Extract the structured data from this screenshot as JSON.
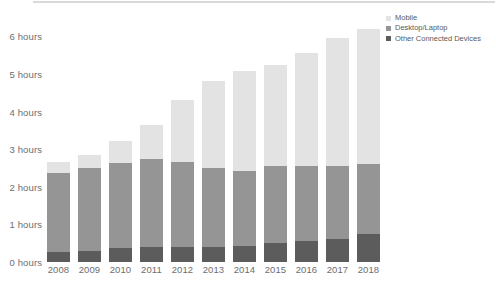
{
  "chart_data": {
    "type": "bar",
    "subtype": "stacked-bar",
    "title": "",
    "subtitle": "",
    "xlabel": "",
    "ylabel": "",
    "categories": [
      "2008",
      "2009",
      "2010",
      "2011",
      "2012",
      "2013",
      "2014",
      "2015",
      "2016",
      "2017",
      "2018"
    ],
    "series": [
      {
        "name": "Other Connected Devices",
        "color": "#5c5c5c",
        "values": [
          0.27,
          0.3,
          0.38,
          0.4,
          0.4,
          0.4,
          0.42,
          0.5,
          0.55,
          0.6,
          0.75
        ]
      },
      {
        "name": "Desktop/Laptop",
        "color": "#959595",
        "values": [
          2.1,
          2.2,
          2.25,
          2.35,
          2.25,
          2.1,
          2.0,
          2.05,
          2.0,
          1.95,
          1.85
        ]
      },
      {
        "name": "Mobile",
        "color": "#e3e3e3",
        "values": [
          0.3,
          0.35,
          0.6,
          0.9,
          1.65,
          2.3,
          2.65,
          2.7,
          3.0,
          3.4,
          3.6
        ]
      }
    ],
    "totals": [
      2.67,
      2.85,
      3.23,
      3.65,
      4.3,
      4.8,
      5.07,
      5.25,
      5.55,
      5.95,
      6.2
    ],
    "stack_order": [
      "Other Connected Devices",
      "Desktop/Laptop",
      "Mobile"
    ],
    "y_ticks": [
      {
        "value": 0,
        "label": "0 hours"
      },
      {
        "value": 1,
        "label": "1 hours"
      },
      {
        "value": 2,
        "label": "2 hours"
      },
      {
        "value": 3,
        "label": "3 hours"
      },
      {
        "value": 4,
        "label": "4 hours"
      },
      {
        "value": 5,
        "label": "5 hours"
      },
      {
        "value": 6,
        "label": "6 hours"
      }
    ],
    "ylim": [
      0,
      6.7
    ],
    "grid": false,
    "legend_position": "top-right",
    "legend": [
      {
        "label": "Mobile",
        "color": "#e3e3e3"
      },
      {
        "label": "Desktop/Laptop",
        "color": "#959595"
      },
      {
        "label": "Other Connected Devices",
        "color": "#5c5c5c"
      }
    ]
  },
  "colors": {
    "background": "#ffffff",
    "axis_text": "#6d6e71",
    "legend_text": "#58595b",
    "rule": "#d9d9d9",
    "mobile": "#e3e3e3",
    "desktop": "#959595",
    "other": "#5c5c5c"
  }
}
